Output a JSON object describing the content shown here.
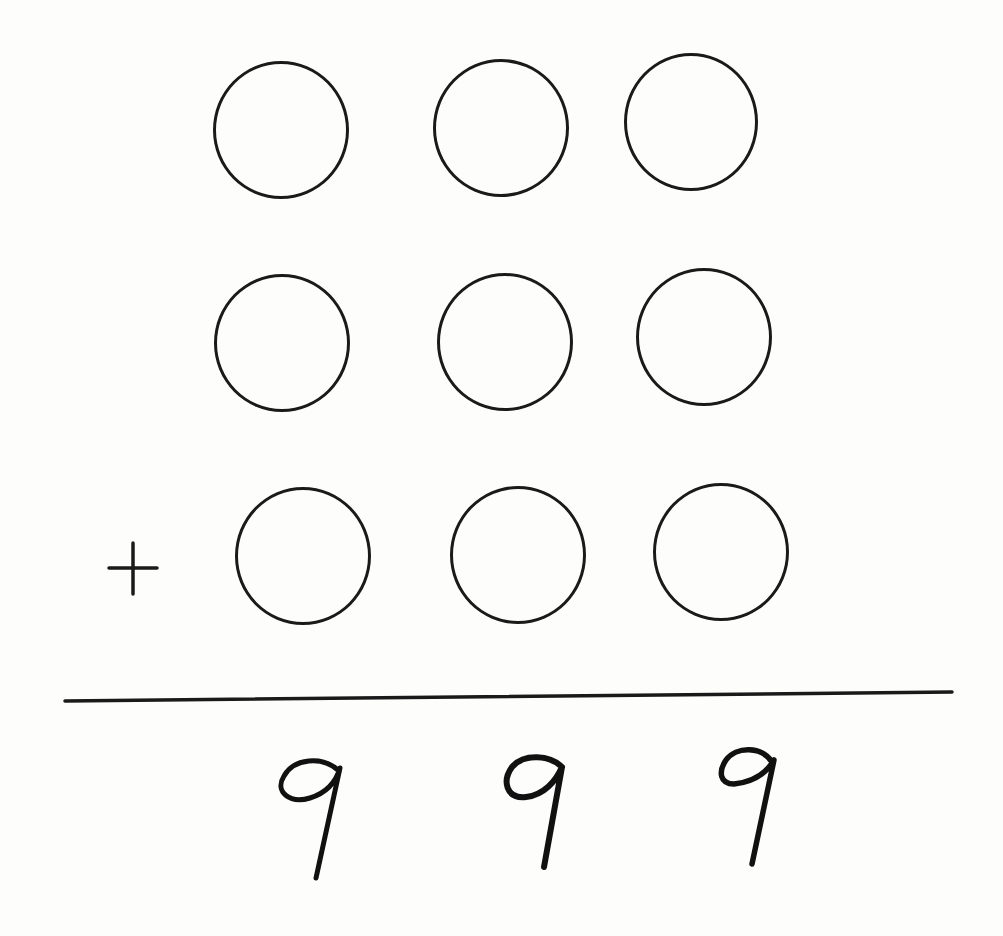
{
  "puzzle": {
    "type": "addition",
    "operator": "+",
    "rows": [
      {
        "cells": [
          "",
          "",
          ""
        ]
      },
      {
        "cells": [
          "",
          "",
          ""
        ]
      },
      {
        "cells": [
          "",
          "",
          ""
        ]
      }
    ],
    "result": [
      "9",
      "9",
      "9"
    ],
    "result_text": "999"
  },
  "colors": {
    "ink": "#1a1a1a",
    "paper": "#fdfdfc"
  },
  "geometry": {
    "circles": [
      [
        {
          "cx": 281,
          "cy": 130,
          "rx": 68,
          "ry": 69
        },
        {
          "cx": 501,
          "cy": 128,
          "rx": 68,
          "ry": 69
        },
        {
          "cx": 691,
          "cy": 122,
          "rx": 67,
          "ry": 69
        }
      ],
      [
        {
          "cx": 282,
          "cy": 343,
          "rx": 68,
          "ry": 69
        },
        {
          "cx": 505,
          "cy": 342,
          "rx": 68,
          "ry": 69
        },
        {
          "cx": 704,
          "cy": 337,
          "rx": 68,
          "ry": 69
        }
      ],
      [
        {
          "cx": 303,
          "cy": 556,
          "rx": 68,
          "ry": 69
        },
        {
          "cx": 518,
          "cy": 555,
          "rx": 68,
          "ry": 69
        },
        {
          "cx": 721,
          "cy": 552,
          "rx": 68,
          "ry": 69
        }
      ]
    ],
    "plus": {
      "cx": 133,
      "cy": 567
    },
    "line": {
      "x1": 65,
      "y1": 701,
      "x2": 952,
      "y2": 692
    },
    "digits": [
      {
        "x": 272,
        "y": 748
      },
      {
        "x": 490,
        "y": 745
      },
      {
        "x": 698,
        "y": 740
      }
    ]
  }
}
